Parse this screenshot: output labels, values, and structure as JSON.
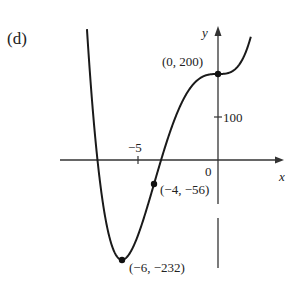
{
  "panel_label": "(d)",
  "chart_data": {
    "type": "line",
    "title": "",
    "function": "f(x) = x^4 + 8x^3 + 200",
    "xlabel": "x",
    "ylabel": "y",
    "x_ticks": [
      {
        "value": -5,
        "label": "−5"
      },
      {
        "value": 0,
        "label": "0"
      }
    ],
    "y_ticks": [
      {
        "value": 100,
        "label": "100"
      }
    ],
    "xlim": [
      -9.8,
      3.8
    ],
    "ylim": [
      -250,
      300
    ],
    "grid": false,
    "legend": null,
    "marked_points": [
      {
        "x": 0,
        "y": 200,
        "label": "(0, 200)"
      },
      {
        "x": -4,
        "y": -56,
        "label": "(−4, −56)"
      },
      {
        "x": -6,
        "y": -232,
        "label": "(−6, −232)"
      }
    ],
    "series": [
      {
        "name": "f(x)",
        "x": [
          -8.2,
          -8,
          -7,
          -6,
          -5,
          -4,
          -3,
          -2,
          -1,
          0,
          1,
          2
        ],
        "values": [
          310.6,
          200,
          -143,
          -232,
          -175,
          -56,
          65,
          152,
          193,
          200,
          209,
          280
        ]
      }
    ]
  },
  "labels": {
    "y_axis": "y",
    "x_axis": "x",
    "tick_neg5": "−5",
    "tick_0": "0",
    "tick_100": "100",
    "pt_0_200": "(0, 200)",
    "pt_m4_m56": "(−4, −56)",
    "pt_m6_m232": "(−6, −232)"
  }
}
